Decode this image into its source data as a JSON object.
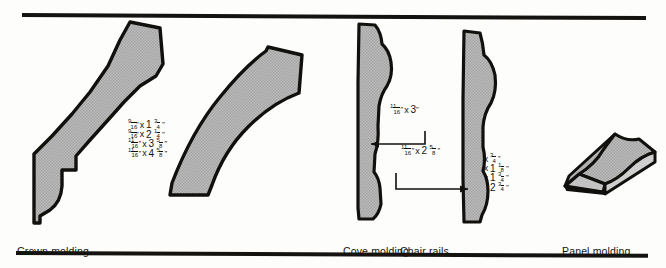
{
  "figure": {
    "stroke_color": "#12100c",
    "fill_color": "#b9b9b9",
    "rule_color": "#15130f"
  },
  "sections": [
    {
      "id": "crown",
      "caption": "Crown molding",
      "dimensions": [
        {
          "w_num": "9",
          "w_den": "16",
          "h_whole": "1",
          "h_num": "3",
          "h_den": "4"
        },
        {
          "w_num": "9",
          "w_den": "16",
          "h_whole": "2",
          "h_num": "1",
          "h_den": "4"
        },
        {
          "w_num": "11",
          "w_den": "16",
          "h_whole": "3",
          "h_num": "5",
          "h_den": "8"
        },
        {
          "w_num": "11",
          "w_den": "16",
          "h_whole": "4",
          "h_num": "5",
          "h_den": "8"
        }
      ]
    },
    {
      "id": "cove",
      "caption": "Cove molding",
      "dimensions": [
        {
          "w_num": "3",
          "w_den": "4",
          "h_whole": "",
          "h_num": "3",
          "h_den": "4"
        },
        {
          "w_num": "3",
          "w_den": "4",
          "h_whole": "1",
          "h_num": "1",
          "h_den": "8"
        },
        {
          "w_num": "9",
          "w_den": "16",
          "h_whole": "1",
          "h_num": "3",
          "h_den": "4"
        },
        {
          "w_num": "9",
          "w_den": "16",
          "h_whole": "2",
          "h_num": "3",
          "h_den": "4"
        }
      ]
    },
    {
      "id": "chair",
      "caption": "Chair rails",
      "callouts": [
        {
          "w_num": "11",
          "w_den": "16",
          "h_whole": "3",
          "h_num": "",
          "h_den": ""
        },
        {
          "w_num": "11",
          "w_den": "16",
          "h_whole": "2",
          "h_num": "5",
          "h_den": "8"
        }
      ]
    },
    {
      "id": "panel",
      "caption": "Panel molding",
      "dimensions": [
        {
          "w_num": "9",
          "w_den": "16",
          "h_whole": "1",
          "h_num": "1",
          "h_den": "8"
        },
        {
          "w_num": "11",
          "w_den": "16",
          "h_whole": "1",
          "h_num": "5",
          "h_den": "8"
        }
      ]
    }
  ],
  "symbols": {
    "inch_mark": "''",
    "multiply": "x"
  }
}
